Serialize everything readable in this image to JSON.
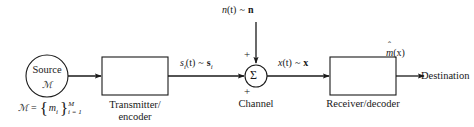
{
  "diagram": {
    "ink_color": "#1a1a1a",
    "background": "#ffffff",
    "nodes": {
      "source": {
        "shape": "circle",
        "label_line1": "Source",
        "label_line2": "ℳ",
        "cx": 47,
        "cy": 76,
        "r": 21
      },
      "transmitter": {
        "shape": "rect",
        "caption_line1": "Transmitter/",
        "caption_line2": "encoder",
        "x": 102,
        "y": 57,
        "w": 66,
        "h": 38
      },
      "summer": {
        "shape": "circle",
        "symbol": "Σ",
        "plus_top": "+",
        "plus_bottom": "+",
        "caption": "Channel",
        "cx": 256,
        "cy": 76,
        "r": 11
      },
      "receiver": {
        "shape": "rect",
        "caption": "Receiver/decoder",
        "x": 330,
        "y": 57,
        "w": 66,
        "h": 38
      },
      "destination": {
        "shape": "text",
        "label": "Destination"
      }
    },
    "signals": {
      "source_set": {
        "lhs": "ℳ",
        "eq": "=",
        "open_brace": "{",
        "body": "m",
        "body_sub": "i",
        "close_brace": "}",
        "sub": "i = 1",
        "sup": "M"
      },
      "transmitted": {
        "time": "s",
        "time_sub": "i",
        "time_arg": "(t)",
        "tilde": "~",
        "vector": "s",
        "vector_sub": "i"
      },
      "noise": {
        "time": "n",
        "time_arg": "(t)",
        "tilde": "~",
        "vector": "n"
      },
      "received": {
        "time": "x",
        "time_arg": "(t)",
        "tilde": "~",
        "vector": "x"
      },
      "estimate": {
        "hat": "ˆ",
        "base": "m",
        "arg": "(x)"
      }
    }
  }
}
